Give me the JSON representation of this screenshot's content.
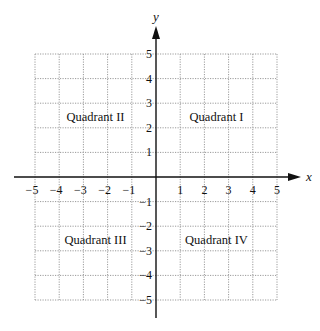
{
  "chart_data": {
    "type": "coordinate-plane",
    "title": "",
    "xlabel": "x",
    "ylabel": "y",
    "xlim": [
      -5,
      5
    ],
    "ylim": [
      -5,
      5
    ],
    "grid": true,
    "grid_style": "dotted",
    "x_ticks": [
      -5,
      -4,
      -3,
      -2,
      -1,
      1,
      2,
      3,
      4,
      5
    ],
    "y_ticks": [
      -5,
      -4,
      -3,
      -2,
      -1,
      1,
      2,
      3,
      4,
      5
    ],
    "x_tick_labels": [
      "−5",
      "−4",
      "−3",
      "−2",
      "−1",
      "1",
      "2",
      "3",
      "4",
      "5"
    ],
    "y_tick_labels": [
      "−5",
      "−4",
      "−3",
      "−2",
      "−1",
      "1",
      "2",
      "3",
      "4",
      "5"
    ],
    "annotations": [
      {
        "text": "Quadrant I",
        "x": 2.5,
        "y": 2.5
      },
      {
        "text": "Quadrant II",
        "x": -2.5,
        "y": 2.5
      },
      {
        "text": "Quadrant III",
        "x": -2.5,
        "y": -2.5
      },
      {
        "text": "Quadrant IV",
        "x": 2.5,
        "y": -2.5
      }
    ]
  },
  "colors": {
    "axis": "#111111",
    "grid": "#9a9a9a",
    "text": "#111111"
  }
}
